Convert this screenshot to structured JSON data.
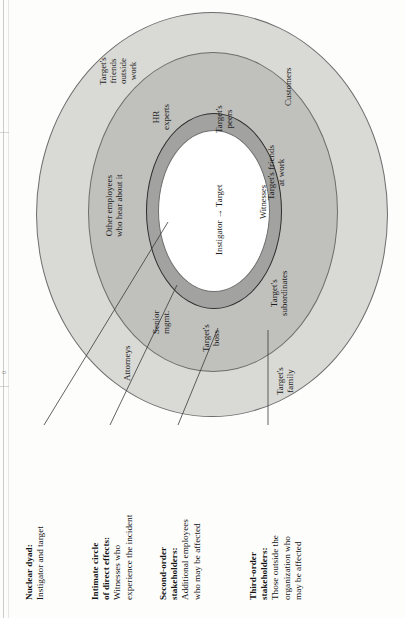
{
  "figure": {
    "type": "concentric-ripple-diagram",
    "orientation": "rotated-90-ccw",
    "folio": "0"
  },
  "colors": {
    "outer_ring": "#d9d9d5",
    "mid_ring": "#c0c0bd",
    "inner_ring": "#a2a2a0",
    "core": "#ffffff",
    "stroke": "#6d6d6d",
    "inner_stroke": "#2e2e2e",
    "text": "#1b1b1b"
  },
  "core": {
    "label": "Instigator → Target"
  },
  "inner_ring": {
    "name": "intimate-circle-of-direct-effects",
    "labels": [
      "Witnesses"
    ]
  },
  "mid_ring": {
    "name": "second-order-stakeholders",
    "labels": [
      "Other employees\nwho hear about it",
      "HR\nexperts",
      "Target's\npeers",
      "Target's friends\nat work",
      "Target's\nsubordinates",
      "Target's\nboss",
      "Senior\nmgmt."
    ]
  },
  "outer_ring": {
    "name": "third-order-stakeholders",
    "labels": [
      "Target's\nfriends\noutside\nwork",
      "Customers",
      "Target's\nfamily",
      "Attorneys"
    ]
  },
  "legend": [
    {
      "title": "Nuclear dyad:",
      "description": "Instigator and target"
    },
    {
      "title": "Intimate circle\nof direct effects:",
      "description": "Witnesses who\nexperience the incident"
    },
    {
      "title": "Second-order\nstakeholders:",
      "description": "Additional employees\nwho may be affected"
    },
    {
      "title": "Third-order\nstakeholders:",
      "description": "Those outside the\norganization who\nmay be affected"
    }
  ]
}
